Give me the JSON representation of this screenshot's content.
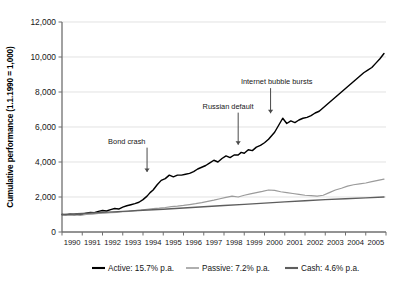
{
  "chart_data": {
    "type": "line",
    "title": "",
    "xlabel": "",
    "ylabel": "Cumulative performance (1.1.1990 = 1,000)",
    "xlim": [
      1990,
      2006
    ],
    "ylim": [
      0,
      12000
    ],
    "grid": true,
    "legend_position": "bottom",
    "ytick_labels": [
      "0",
      "2,000",
      "4,000",
      "6,000",
      "8,000",
      "10,000",
      "12,000"
    ],
    "ytick_values": [
      0,
      2000,
      4000,
      6000,
      8000,
      10000,
      12000
    ],
    "xtick_labels": [
      "1990",
      "1991",
      "1992",
      "1993",
      "1994",
      "1995",
      "1996",
      "1997",
      "1998",
      "1999",
      "2000",
      "2001",
      "2002",
      "2003",
      "2004",
      "2005"
    ],
    "xtick_values": [
      1990,
      1991,
      1992,
      1993,
      1994,
      1995,
      1996,
      1997,
      1998,
      1999,
      2000,
      2001,
      2002,
      2003,
      2004,
      2005
    ],
    "annotations": [
      {
        "label": "Bond crash",
        "x": 1994.2,
        "y": 3150,
        "text_x": 1993.2,
        "text_y": 5050
      },
      {
        "label": "Russian default",
        "x": 1998.7,
        "y": 4700,
        "text_x": 1998.2,
        "text_y": 7050
      },
      {
        "label": "Internet bubble bursts",
        "x": 2000.3,
        "y": 6500,
        "text_x": 2000.6,
        "text_y": 8450
      }
    ],
    "series": [
      {
        "name": "Active",
        "legend_label": "Active: 15.7% p.a.",
        "color": "#000000",
        "annual_return": "15.7% p.a.",
        "x": [
          1990.0,
          1990.2,
          1990.4,
          1990.6,
          1990.8,
          1991.0,
          1991.2,
          1991.4,
          1991.6,
          1991.8,
          1992.0,
          1992.2,
          1992.4,
          1992.6,
          1992.8,
          1993.0,
          1993.2,
          1993.4,
          1993.6,
          1993.8,
          1994.0,
          1994.2,
          1994.35,
          1994.5,
          1994.7,
          1994.9,
          1995.1,
          1995.3,
          1995.5,
          1995.7,
          1995.9,
          1996.1,
          1996.3,
          1996.5,
          1996.7,
          1996.9,
          1997.1,
          1997.3,
          1997.5,
          1997.7,
          1997.9,
          1998.1,
          1998.3,
          1998.5,
          1998.7,
          1998.85,
          1999.0,
          1999.2,
          1999.4,
          1999.6,
          1999.8,
          2000.0,
          2000.2,
          2000.35,
          2000.5,
          2000.7,
          2000.9,
          2001.1,
          2001.3,
          2001.5,
          2001.7,
          2001.9,
          2002.1,
          2002.3,
          2002.5,
          2002.7,
          2002.9,
          2003.1,
          2003.3,
          2003.5,
          2003.7,
          2003.9,
          2004.1,
          2004.3,
          2004.5,
          2004.7,
          2004.9,
          2005.1,
          2005.3,
          2005.5,
          2005.7,
          2005.9
        ],
        "y": [
          1000,
          980,
          1010,
          990,
          1030,
          1020,
          1080,
          1120,
          1100,
          1180,
          1230,
          1200,
          1280,
          1340,
          1310,
          1420,
          1500,
          1560,
          1620,
          1700,
          1850,
          2050,
          2250,
          2400,
          2700,
          2950,
          3050,
          3250,
          3150,
          3250,
          3250,
          3300,
          3350,
          3450,
          3600,
          3700,
          3800,
          3950,
          4100,
          4000,
          4200,
          4350,
          4250,
          4400,
          4400,
          4550,
          4500,
          4700,
          4650,
          4850,
          4950,
          5100,
          5300,
          5500,
          5700,
          6100,
          6500,
          6200,
          6350,
          6250,
          6400,
          6500,
          6550,
          6650,
          6800,
          6900,
          7100,
          7300,
          7500,
          7700,
          7900,
          8100,
          8300,
          8500,
          8700,
          8900,
          9100,
          9250,
          9400,
          9650,
          9900,
          10200
        ]
      },
      {
        "name": "Passive",
        "legend_label": "Passive: 7.2% p.a.",
        "color": "#9b9b9b",
        "annual_return": "7.2% p.a.",
        "x": [
          1990.0,
          1990.3,
          1990.6,
          1990.9,
          1991.2,
          1991.5,
          1991.8,
          1992.1,
          1992.4,
          1992.7,
          1993.0,
          1993.3,
          1993.6,
          1993.9,
          1994.2,
          1994.5,
          1994.8,
          1995.1,
          1995.4,
          1995.7,
          1996.0,
          1996.3,
          1996.6,
          1996.9,
          1997.2,
          1997.5,
          1997.8,
          1998.1,
          1998.4,
          1998.7,
          1999.0,
          1999.3,
          1999.6,
          1999.9,
          2000.2,
          2000.5,
          2000.8,
          2001.1,
          2001.4,
          2001.7,
          2002.0,
          2002.3,
          2002.6,
          2002.9,
          2003.2,
          2003.5,
          2003.8,
          2004.1,
          2004.4,
          2004.7,
          2005.0,
          2005.3,
          2005.6,
          2005.9
        ],
        "y": [
          1000,
          960,
          980,
          950,
          1000,
          1020,
          1060,
          1080,
          1100,
          1120,
          1160,
          1180,
          1220,
          1250,
          1300,
          1330,
          1360,
          1400,
          1450,
          1480,
          1520,
          1570,
          1620,
          1680,
          1750,
          1820,
          1900,
          1980,
          2050,
          2000,
          2100,
          2180,
          2250,
          2320,
          2400,
          2380,
          2300,
          2250,
          2200,
          2150,
          2100,
          2080,
          2050,
          2100,
          2250,
          2400,
          2500,
          2620,
          2700,
          2750,
          2800,
          2880,
          2950,
          3020
        ]
      },
      {
        "name": "Cash",
        "legend_label": "Cash: 4.6% p.a.",
        "color": "#5e5e5e",
        "annual_return": "4.6% p.a.",
        "x": [
          1990.0,
          1991.0,
          1992.0,
          1993.0,
          1994.0,
          1995.0,
          1996.0,
          1997.0,
          1998.0,
          1999.0,
          2000.0,
          2001.0,
          2002.0,
          2003.0,
          2004.0,
          2005.0,
          2005.9
        ],
        "y": [
          1000,
          1060,
          1120,
          1180,
          1240,
          1300,
          1370,
          1440,
          1510,
          1580,
          1650,
          1720,
          1790,
          1850,
          1900,
          1950,
          2000
        ]
      }
    ]
  }
}
